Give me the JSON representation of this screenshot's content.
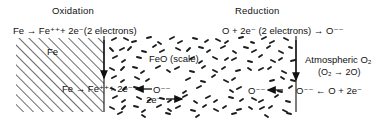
{
  "figure": {
    "type": "corrosion-mechanism-diagram",
    "headers": {
      "left": "Oxidation",
      "right": "Reduction"
    },
    "equations": {
      "oxidation_top": "Fe → Fe⁺⁺+ 2e⁻(2 electrons)",
      "reduction_top": "O + 2e⁻ (2 electrons) → O⁻⁻",
      "oxidation_bottom": "Fe → Fe⁺⁺+ 2e⁻",
      "reduction_bottom": "O⁻⁻ ← O + 2e⁻"
    },
    "regions": {
      "metal_label": "Fe",
      "scale_label": "FeO (scale)",
      "atmosphere_label": "Atmospheric O₂",
      "atmosphere_equation": "(O₂ → 2O)"
    },
    "species": {
      "oxide_ion_left": "O⁻⁻",
      "electron_flux": "2e⁻",
      "oxide_ion_right": "O⁻⁻"
    },
    "colors": {
      "ink": "#111111",
      "background": "#ffffff",
      "hatch": "#3a3a3a",
      "speckle": "#1c1c1c"
    }
  }
}
